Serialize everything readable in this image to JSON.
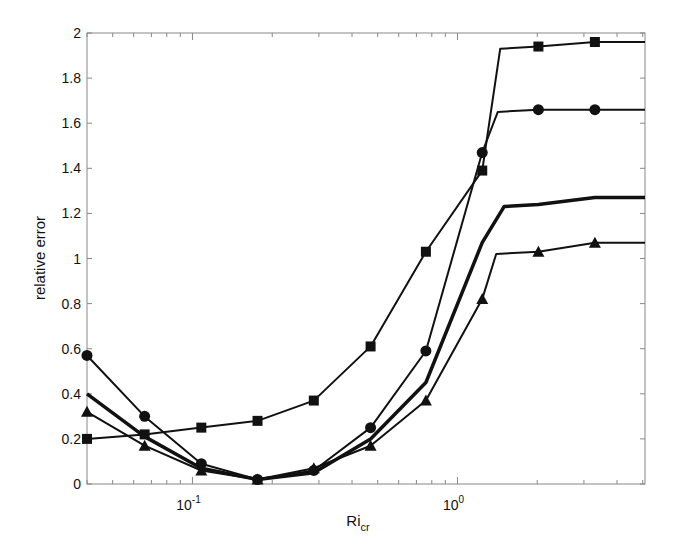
{
  "chart_data": {
    "type": "line",
    "title": "",
    "xlabel": "Ri",
    "xlabel_subscript": "cr",
    "ylabel": "relative error",
    "xscale": "log",
    "xlim": [
      0.04,
      5.1
    ],
    "ylim": [
      0,
      2
    ],
    "grid": false,
    "legend": null,
    "x_ticks": [
      {
        "value": 0.1,
        "base": "10",
        "exp": "-1"
      },
      {
        "value": 1,
        "base": "10",
        "exp": "0"
      }
    ],
    "y_ticks": [
      "0",
      "0.2",
      "0.4",
      "0.6",
      "0.8",
      "1",
      "1.2",
      "1.4",
      "1.6",
      "1.8",
      "2"
    ],
    "x": [
      0.04,
      0.066,
      0.108,
      0.176,
      0.287,
      0.47,
      0.76,
      1.24,
      2.02,
      3.3
    ],
    "series": [
      {
        "name": "square-marker series",
        "marker": "square",
        "line_width": 2,
        "values": [
          0.2,
          0.22,
          0.25,
          0.28,
          0.37,
          0.61,
          1.03,
          1.39,
          1.94,
          1.96
        ],
        "end_value": 1.96,
        "knee_x": 1.45
      },
      {
        "name": "circle-marker series",
        "marker": "circle",
        "line_width": 2,
        "values": [
          0.57,
          0.3,
          0.09,
          0.02,
          0.06,
          0.25,
          0.59,
          1.47,
          1.66,
          1.66
        ],
        "end_value": 1.66,
        "knee_x": 1.42
      },
      {
        "name": "thick unmarked series",
        "marker": "none",
        "line_width": 3.5,
        "values": [
          0.4,
          0.21,
          0.07,
          0.02,
          0.05,
          0.2,
          0.45,
          1.07,
          1.24,
          1.27
        ],
        "end_value": 1.27,
        "knee_x": 1.5
      },
      {
        "name": "triangle-marker series",
        "marker": "triangle",
        "line_width": 2,
        "values": [
          0.32,
          0.17,
          0.06,
          0.02,
          0.07,
          0.17,
          0.37,
          0.82,
          1.03,
          1.07
        ],
        "end_value": 1.07,
        "knee_x": 1.4
      }
    ],
    "colors": {
      "line": "#111111",
      "axis": "#888888",
      "background": "#ffffff"
    }
  }
}
